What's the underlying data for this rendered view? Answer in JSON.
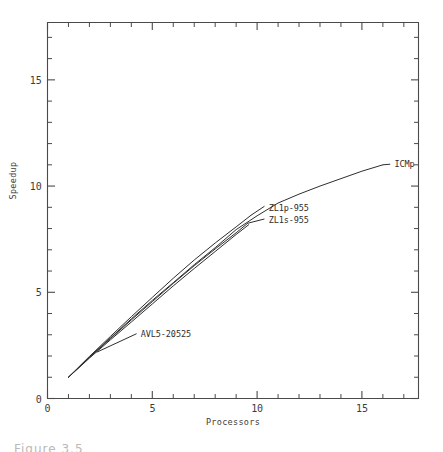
{
  "figure": {
    "caption_partial": "Figure 3.5"
  },
  "chart_data": {
    "type": "line",
    "title": "",
    "xlabel": "Processors",
    "ylabel": "Speedup",
    "xlim": [
      0,
      17.7
    ],
    "ylim": [
      0,
      17.7
    ],
    "grid": false,
    "legend_position": "inline-labels",
    "x_ticks_major": [
      0,
      5,
      10,
      15
    ],
    "x_tick_labels": [
      "0",
      "5",
      "10",
      "15"
    ],
    "y_ticks_major": [
      0,
      5,
      10,
      15
    ],
    "y_tick_labels": [
      "0",
      "5",
      "10",
      "15"
    ],
    "tick_minor_step": 1,
    "ticks_all_sides": true,
    "series": [
      {
        "name": "ICMp",
        "label": "ICMp",
        "label_x": 16.55,
        "label_y": 11.03,
        "leader_from": [
          16.0,
          11.0
        ],
        "leader_to": [
          16.35,
          11.03
        ],
        "x": [
          1.0,
          2.0,
          3.0,
          4.0,
          5.0,
          6.0,
          7.0,
          8.0,
          9.0,
          10.0,
          11.0,
          12.0,
          13.0,
          14.0,
          15.0,
          16.0
        ],
        "y": [
          1.0,
          1.95,
          2.85,
          3.75,
          4.62,
          5.45,
          6.3,
          7.1,
          7.95,
          8.6,
          9.2,
          9.62,
          10.0,
          10.35,
          10.7,
          11.0
        ]
      },
      {
        "name": "ZL1p-955",
        "label": "ZL1p-955",
        "label_x": 10.55,
        "label_y": 9.0,
        "leader_from": [
          9.7,
          8.62
        ],
        "leader_to": [
          10.35,
          9.05
        ],
        "x": [
          1.0,
          2.0,
          3.0,
          4.0,
          5.0,
          6.0,
          7.0,
          8.0,
          9.0,
          9.7
        ],
        "y": [
          1.0,
          1.98,
          2.92,
          3.85,
          4.76,
          5.66,
          6.52,
          7.32,
          8.08,
          8.62
        ]
      },
      {
        "name": "ZL1s-955",
        "label": "ZL1s-955",
        "label_x": 10.55,
        "label_y": 8.4,
        "leader_from": [
          9.55,
          8.25
        ],
        "leader_to": [
          10.35,
          8.45
        ],
        "x": [
          1.0,
          2.0,
          3.0,
          4.0,
          5.0,
          6.0,
          7.0,
          8.0,
          9.0,
          9.55
        ],
        "y": [
          1.0,
          1.93,
          2.82,
          3.7,
          4.56,
          5.42,
          6.25,
          7.04,
          7.8,
          8.25
        ]
      },
      {
        "name": "AVL5-20525",
        "label": "AVL5-20525",
        "label_x": 4.45,
        "label_y": 3.05,
        "leader_from": [
          2.35,
          2.18
        ],
        "leader_to": [
          4.25,
          3.05
        ],
        "x": [
          1.0,
          2.0,
          3.0,
          4.0,
          5.0,
          6.0,
          7.0,
          8.0,
          9.0,
          9.6
        ],
        "y": [
          1.0,
          1.9,
          2.76,
          3.6,
          4.45,
          5.3,
          6.12,
          6.92,
          7.72,
          8.18
        ]
      }
    ]
  }
}
